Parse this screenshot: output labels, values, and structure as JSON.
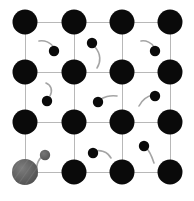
{
  "figure": {
    "width": 194,
    "height": 201,
    "background_color": "#ffffff"
  },
  "colors": {
    "lattice_atom": "#0a0a0a",
    "lattice_bond": "#b8b8b8",
    "particle": "#0a0a0a",
    "particle_trail": "#9a9a9a",
    "highlight_atom": "#5e5e5e",
    "highlight_atom_shade": "#7a7a7a",
    "highlight_particle": "#5e5e5e",
    "highlight_trail": "#9a9a9a"
  },
  "chart_data": {
    "type": "scatter",
    "xlabel": "",
    "ylabel": "",
    "xlim": [
      0,
      194
    ],
    "ylim": [
      0,
      201
    ],
    "grid": true,
    "legend_position": "none",
    "lattice": {
      "rows": 4,
      "columns": 4,
      "x_positions": [
        25,
        74,
        122,
        170
      ],
      "y_positions": [
        22,
        72,
        122,
        172
      ],
      "spacing_x": 48.3,
      "spacing_y": 50,
      "atom_radius": 12.5,
      "bond_width": 1
    },
    "series": [
      {
        "name": "lattice-atoms",
        "marker": "filled-circle",
        "color": "#0a0a0a",
        "radius": 12.5,
        "points": [
          {
            "id": "atom-r0-c0",
            "x": 25,
            "y": 22,
            "row": 0,
            "col": 0
          },
          {
            "id": "atom-r0-c1",
            "x": 74,
            "y": 22,
            "row": 0,
            "col": 1
          },
          {
            "id": "atom-r0-c2",
            "x": 122,
            "y": 22,
            "row": 0,
            "col": 2
          },
          {
            "id": "atom-r0-c3",
            "x": 170,
            "y": 22,
            "row": 0,
            "col": 3
          },
          {
            "id": "atom-r1-c0",
            "x": 25,
            "y": 72,
            "row": 1,
            "col": 0
          },
          {
            "id": "atom-r1-c1",
            "x": 74,
            "y": 72,
            "row": 1,
            "col": 1
          },
          {
            "id": "atom-r1-c2",
            "x": 122,
            "y": 72,
            "row": 1,
            "col": 2
          },
          {
            "id": "atom-r1-c3",
            "x": 170,
            "y": 72,
            "row": 1,
            "col": 3
          },
          {
            "id": "atom-r2-c0",
            "x": 25,
            "y": 122,
            "row": 2,
            "col": 0
          },
          {
            "id": "atom-r2-c1",
            "x": 74,
            "y": 122,
            "row": 2,
            "col": 1
          },
          {
            "id": "atom-r2-c2",
            "x": 122,
            "y": 122,
            "row": 2,
            "col": 2
          },
          {
            "id": "atom-r2-c3",
            "x": 170,
            "y": 122,
            "row": 2,
            "col": 3
          },
          {
            "id": "atom-r3-c1",
            "x": 74,
            "y": 172,
            "row": 3,
            "col": 1
          },
          {
            "id": "atom-r3-c2",
            "x": 122,
            "y": 172,
            "row": 3,
            "col": 2
          },
          {
            "id": "atom-r3-c3",
            "x": 170,
            "y": 172,
            "row": 3,
            "col": 3
          }
        ]
      },
      {
        "name": "highlighted-lattice-atom",
        "marker": "shaded-circle",
        "color": "#5e5e5e",
        "radius": 13,
        "points": [
          {
            "id": "atom-r3-c0-highlight",
            "x": 25,
            "y": 172,
            "row": 3,
            "col": 0
          }
        ]
      },
      {
        "name": "interstitial-particles",
        "marker": "filled-circle-with-trail",
        "color": "#0a0a0a",
        "radius": 5.2,
        "points": [
          {
            "id": "particle-1",
            "x": 54,
            "y": 51,
            "trail": "M 39,41 C 44,40 51,42 54,48"
          },
          {
            "id": "particle-2",
            "x": 92,
            "y": 43,
            "trail": "M 95,47 C 101,54 101,62 97,68"
          },
          {
            "id": "particle-3",
            "x": 155,
            "y": 51,
            "trail": "M 141,41 C 146,40 152,43 154,47"
          },
          {
            "id": "particle-4",
            "x": 47,
            "y": 101,
            "trail": "M 50,96 C 53,90 51,85 46,83"
          },
          {
            "id": "particle-5",
            "x": 98,
            "y": 102,
            "trail": "M 117,96 C 110,95 103,97 100,100"
          },
          {
            "id": "particle-6",
            "x": 155,
            "y": 96,
            "trail": "M 139,106 C 142,100 148,96 153,95"
          },
          {
            "id": "particle-7",
            "x": 93,
            "y": 153,
            "trail": "M 111,158 C 107,151 100,150 95,151"
          },
          {
            "id": "particle-8",
            "x": 144,
            "y": 146,
            "trail": "M 154,163 C 152,157 149,150 146,148"
          }
        ]
      },
      {
        "name": "highlighted-interstitial-particle",
        "marker": "shaded-circle-with-trail",
        "color": "#5e5e5e",
        "radius": 5.2,
        "points": [
          {
            "id": "particle-highlight",
            "x": 45,
            "y": 155,
            "trail": "M 37,176 C 35,167 38,159 43,156"
          }
        ]
      }
    ]
  }
}
